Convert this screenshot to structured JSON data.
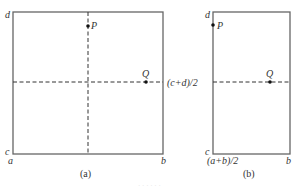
{
  "panels": [
    {
      "id": "a",
      "caption": "(a)",
      "corner_labels": {
        "top_left": "d",
        "bottom_left": "c",
        "bottom_x_left": "a",
        "bottom_x_right": "b"
      },
      "points": [
        {
          "name": "P",
          "label": "P"
        },
        {
          "name": "Q",
          "label": "Q"
        }
      ],
      "dashed_lines": [
        "vertical-midline",
        "horizontal-midline"
      ]
    },
    {
      "id": "b",
      "caption": "(b)",
      "corner_labels": {
        "top_left": "d",
        "bottom_left": "c",
        "bottom_x_left": "(a+b)/2",
        "bottom_x_right": "b",
        "mid_y": "(c+d)/2"
      },
      "points": [
        {
          "name": "P",
          "label": "P"
        },
        {
          "name": "Q",
          "label": "Q"
        }
      ],
      "dashed_lines": [
        "horizontal-midline"
      ]
    }
  ],
  "footer_text": "· · · · · ·",
  "colors": {
    "line": "#555555",
    "point": "#111111",
    "text": "#333333"
  }
}
